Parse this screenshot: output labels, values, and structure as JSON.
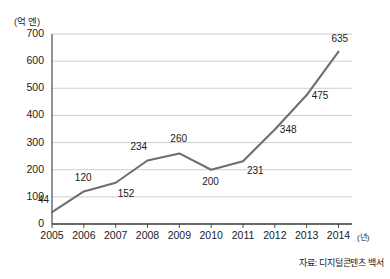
{
  "chart_data": {
    "type": "line",
    "title": "",
    "subtitle": "",
    "xlabel": "(년)",
    "ylabel": "(억 엔)",
    "categories": [
      "2005",
      "2006",
      "2007",
      "2008",
      "2009",
      "2010",
      "2011",
      "2012",
      "2013",
      "2014"
    ],
    "values": [
      44,
      120,
      152,
      234,
      260,
      200,
      231,
      348,
      475,
      635
    ],
    "series": [
      {
        "name": "",
        "values": [
          44,
          120,
          152,
          234,
          260,
          200,
          231,
          348,
          475,
          635
        ]
      }
    ],
    "point_labels": [
      "44",
      "120",
      "152",
      "234",
      "260",
      "200",
      "231",
      "348",
      "475",
      "635"
    ],
    "ylim": [
      0,
      700
    ],
    "yticks": [
      0,
      100,
      200,
      300,
      400,
      500,
      600,
      700
    ],
    "ytick_labels": [
      "0",
      "100",
      "200",
      "300",
      "400",
      "500",
      "600",
      "700"
    ],
    "grid": true,
    "grid_axis": "y",
    "legend": false,
    "legend_position": "none",
    "annotations": {
      "source": "자료: 디지털콘텐츠 백서"
    },
    "colors": {
      "line": "#6e6e6e",
      "grid": "#c9c9c9",
      "axis": "#3a3a3a",
      "text": "#1a1a1a",
      "background": "#ffffff"
    }
  },
  "figure": {
    "y_unit": "(억 엔)",
    "x_unit": "(년)",
    "source": "자료: 디지털콘텐츠 백서"
  }
}
